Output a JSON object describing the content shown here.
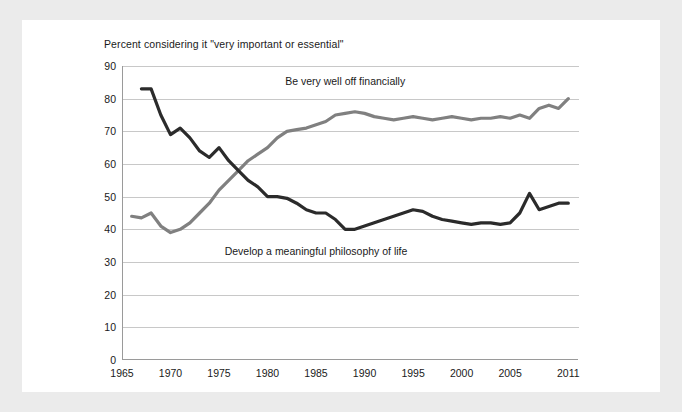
{
  "chart_data": {
    "type": "line",
    "title": "Percent considering it \"very important or essential\"",
    "xlabel": "",
    "ylabel": "",
    "xlim": [
      1965,
      2012
    ],
    "ylim": [
      0,
      90
    ],
    "grid": true,
    "legend_position": "inline-annotations",
    "yticks": [
      0,
      10,
      20,
      30,
      40,
      50,
      60,
      70,
      80,
      90
    ],
    "xticks": [
      1965,
      1970,
      1975,
      1980,
      1985,
      1990,
      1995,
      2000,
      2005,
      2011
    ],
    "xtick_labels": [
      "1965",
      "1970",
      "1975",
      "1980",
      "1985",
      "1990",
      "1995",
      "2000",
      "2005",
      "2011"
    ],
    "ytick_labels": [
      "0",
      "10",
      "20",
      "30",
      "40",
      "50",
      "60",
      "70",
      "80",
      "90"
    ],
    "series": [
      {
        "name": "Be very well off financially",
        "color": "#808080",
        "annotation": "Be very well off financially",
        "annotation_x": 1988,
        "annotation_y": 85,
        "x": [
          1966,
          1967,
          1968,
          1969,
          1970,
          1971,
          1972,
          1973,
          1974,
          1975,
          1976,
          1977,
          1978,
          1979,
          1980,
          1981,
          1982,
          1983,
          1984,
          1985,
          1986,
          1987,
          1988,
          1989,
          1990,
          1991,
          1992,
          1993,
          1994,
          1995,
          1996,
          1997,
          1998,
          1999,
          2000,
          2001,
          2002,
          2003,
          2004,
          2005,
          2006,
          2007,
          2008,
          2009,
          2010,
          2011
        ],
        "values": [
          44,
          43.5,
          45,
          41,
          39,
          40,
          42,
          45,
          48,
          52,
          55,
          58,
          61,
          63,
          65,
          68,
          70,
          70.5,
          71,
          72,
          73,
          75,
          75.5,
          76,
          75.5,
          74.5,
          74,
          73.5,
          74,
          74.5,
          74,
          73.5,
          74,
          74.5,
          74,
          73.5,
          74,
          74,
          74.5,
          74,
          75,
          74,
          77,
          78,
          77,
          80
        ]
      },
      {
        "name": "Develop a meaningful philosophy of life",
        "color": "#2b2b2b",
        "annotation": "Develop a meaningful philosophy of life",
        "annotation_x": 1985,
        "annotation_y": 33,
        "x": [
          1967,
          1968,
          1969,
          1970,
          1971,
          1972,
          1973,
          1974,
          1975,
          1976,
          1977,
          1978,
          1979,
          1980,
          1981,
          1982,
          1983,
          1984,
          1985,
          1986,
          1987,
          1988,
          1989,
          1990,
          1991,
          1992,
          1993,
          1994,
          1995,
          1996,
          1997,
          1998,
          1999,
          2000,
          2001,
          2002,
          2003,
          2004,
          2005,
          2006,
          2007,
          2008,
          2009,
          2010,
          2011
        ],
        "values": [
          83,
          83,
          75,
          69,
          71,
          68,
          64,
          62,
          65,
          61,
          58,
          55,
          53,
          50,
          50,
          49.5,
          48,
          46,
          45,
          45,
          43,
          40,
          40,
          41,
          42,
          43,
          44,
          45,
          46,
          45.5,
          44,
          43,
          42.5,
          42,
          41.5,
          42,
          42,
          41.5,
          42,
          45,
          51,
          46,
          47,
          48,
          48
        ]
      }
    ]
  }
}
